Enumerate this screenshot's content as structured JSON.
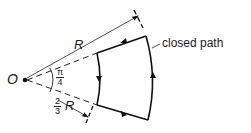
{
  "diagram": {
    "origin_label": "O",
    "radius_label": "R",
    "angle_label": {
      "numerator": "π",
      "denominator": "4"
    },
    "inner_radius_label": {
      "numerator": "2",
      "denominator": "3",
      "suffix": "R"
    },
    "path_label": "closed path"
  }
}
